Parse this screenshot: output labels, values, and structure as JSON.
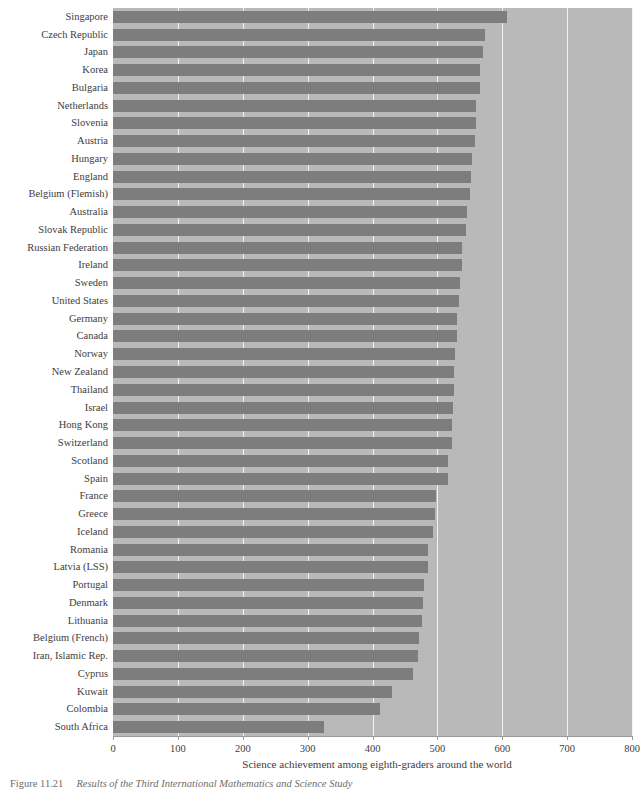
{
  "chart_data": {
    "type": "bar",
    "orientation": "horizontal",
    "title": "",
    "xlabel": "Science achievement among eighth-graders around the world",
    "ylabel": "",
    "xlim": [
      0,
      800
    ],
    "xticks": [
      0,
      100,
      200,
      300,
      400,
      500,
      600,
      700,
      800
    ],
    "xtick_labels": [
      "0",
      "100",
      "200",
      "300",
      "400",
      "500",
      "600",
      "700",
      "800"
    ],
    "grid": true,
    "grid_axis": "x",
    "legend": null,
    "bar_color": "#7d7d7d",
    "plot_background": "#b9b9b9",
    "gridline_color": "#f2f2f2",
    "categories": [
      "Singapore",
      "Czech Republic",
      "Japan",
      "Korea",
      "Bulgaria",
      "Netherlands",
      "Slovenia",
      "Austria",
      "Hungary",
      "England",
      "Belgium (Flemish)",
      "Australia",
      "Slovak Republic",
      "Russian Federation",
      "Ireland",
      "Sweden",
      "United States",
      "Germany",
      "Canada",
      "Norway",
      "New Zealand",
      "Thailand",
      "Israel",
      "Hong Kong",
      "Switzerland",
      "Scotland",
      "Spain",
      "France",
      "Greece",
      "Iceland",
      "Romania",
      "Latvia (LSS)",
      "Portugal",
      "Denmark",
      "Lithuania",
      "Belgium (French)",
      "Iran, Islamic Rep.",
      "Cyprus",
      "Kuwait",
      "Colombia",
      "South Africa"
    ],
    "values": [
      607,
      574,
      571,
      565,
      565,
      560,
      560,
      558,
      554,
      552,
      550,
      545,
      544,
      538,
      538,
      535,
      534,
      531,
      531,
      527,
      525,
      525,
      524,
      522,
      522,
      517,
      517,
      498,
      497,
      494,
      486,
      485,
      480,
      478,
      476,
      471,
      470,
      463,
      430,
      411,
      326
    ]
  },
  "axis": {
    "x_title": "Science achievement among eighth-graders around the world"
  },
  "caption": {
    "number": "Figure 11.21",
    "text": "Results of the Third International Mathematics and Science Study"
  }
}
